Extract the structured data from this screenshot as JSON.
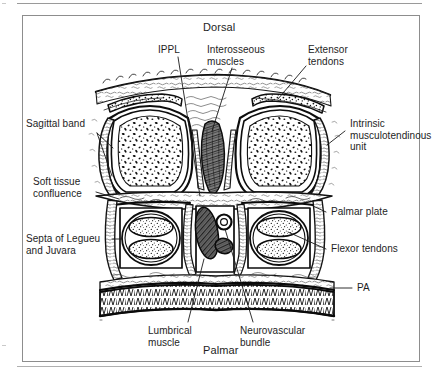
{
  "figure": {
    "type": "anatomical-cross-section",
    "orientation_top": "Dorsal",
    "orientation_bottom": "Palmar"
  },
  "orientation": {
    "top_label": "Dorsal",
    "bottom_label": "Palmar"
  },
  "labels": {
    "ippl": "IPPL",
    "interosseous_muscles": "Interosseous\nmuscles",
    "extensor_tendons": "Extensor\ntendons",
    "sagittal_band": "Sagittal band",
    "intrinsic_unit": "Intrinsic\nmusculotendinous\nunit",
    "soft_tissue_confluence": "Soft tissue\nconfluence",
    "palmar_plate": "Palmar plate",
    "septa": "Septa of Legueu\nand Juvara",
    "flexor_tendons": "Flexor tendons",
    "pa": "PA",
    "lumbrical_muscle": "Lumbrical\nmuscle",
    "neurovascular_bundle": "Neurovascular\nbundle"
  },
  "colors": {
    "ink": "#1a1a1a",
    "frame": "#8d8d8d",
    "rule": "#9a9a9a",
    "paper": "#ffffff"
  }
}
